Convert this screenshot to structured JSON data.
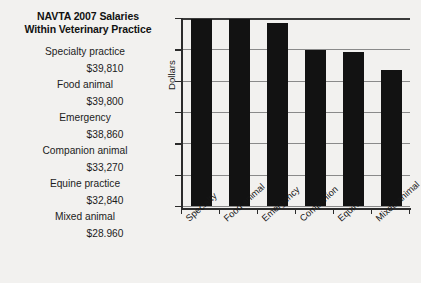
{
  "chart_data": {
    "type": "bar",
    "title": "NAVTA 2007 Salaries Within Veterinary Practice",
    "title_line1": "NAVTA 2007 Salaries",
    "title_line2": "Within Veterinary Practice",
    "xlabel": "",
    "ylabel": "Dollars",
    "categories": [
      "Specialty",
      "Food animal",
      "Emergency",
      "Companion",
      "Equine",
      "Mixed animal"
    ],
    "values": [
      39810,
      39800,
      38860,
      33270,
      32840,
      28960
    ],
    "ylim": [
      0,
      40000
    ],
    "grid": true,
    "gridline_count": 7,
    "legend_position": "left",
    "bar_color": "#121212",
    "background_color": "#f2f1ef",
    "axis_color": "#2b2b2b",
    "gridline_color": "#8a8a8a",
    "legend": [
      {
        "label": "Specialty practice",
        "value": "$39,810"
      },
      {
        "label": "Food animal",
        "value": "$39,800"
      },
      {
        "label": "Emergency",
        "value": "$38,860"
      },
      {
        "label": "Companion animal",
        "value": "$33,270"
      },
      {
        "label": "Equine practice",
        "value": "$32,840"
      },
      {
        "label": "Mixed animal",
        "value": "$28.960"
      }
    ],
    "tick_labels": [
      "Specialty",
      "Food animal",
      "Emergency",
      "Companion",
      "Equine",
      "Mixed animal"
    ]
  }
}
